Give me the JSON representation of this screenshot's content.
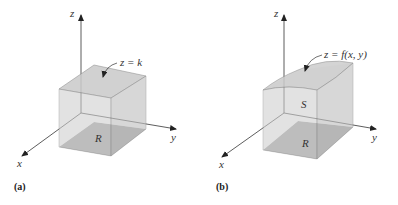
{
  "figure": {
    "panel_a": {
      "tag": "(a)",
      "axes": {
        "x": "x",
        "y": "y",
        "z": "z"
      },
      "top_surface_label": "z = k",
      "base_region_label": "R"
    },
    "panel_b": {
      "tag": "(b)",
      "axes": {
        "x": "x",
        "y": "y",
        "z": "z"
      },
      "top_surface_label": "z = f(x, y)",
      "solid_label": "S",
      "base_region_label": "R"
    }
  },
  "colors": {
    "axis": "#333333",
    "box_face_light": "#e3e3e3",
    "box_face_mid": "#d2d2d2",
    "box_top": "#cfcfcf",
    "base_region": "#9a9a9a",
    "edge": "#8a8a8a"
  }
}
